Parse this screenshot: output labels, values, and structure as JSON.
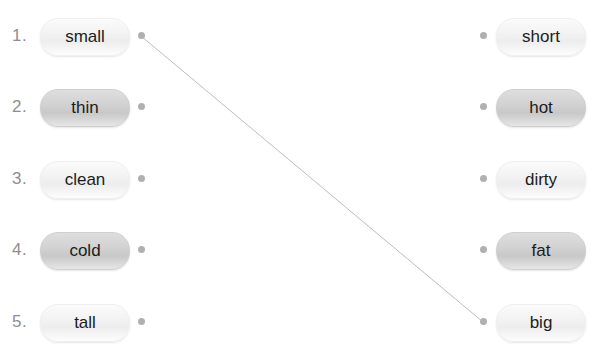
{
  "exercise": {
    "type": "matching-exercise",
    "background_color": "#ffffff",
    "line_color": "#bdbdbd",
    "dot_color": "#b0b0b0",
    "left_column": [
      {
        "number": "1.",
        "label": "small",
        "shade": "light"
      },
      {
        "number": "2.",
        "label": "thin",
        "shade": "dark"
      },
      {
        "number": "3.",
        "label": "clean",
        "shade": "light"
      },
      {
        "number": "4.",
        "label": "cold",
        "shade": "dark"
      },
      {
        "number": "5.",
        "label": "tall",
        "shade": "light"
      }
    ],
    "right_column": [
      {
        "label": "short",
        "shade": "light"
      },
      {
        "label": "hot",
        "shade": "dark"
      },
      {
        "label": "dirty",
        "shade": "light"
      },
      {
        "label": "fat",
        "shade": "dark"
      },
      {
        "label": "big",
        "shade": "light"
      }
    ],
    "connections": [
      {
        "from": "small",
        "to": "big",
        "x1": 141,
        "y1": 36,
        "x2": 483,
        "y2": 322
      }
    ],
    "row_centers": [
      36,
      107,
      179,
      250,
      322
    ]
  }
}
